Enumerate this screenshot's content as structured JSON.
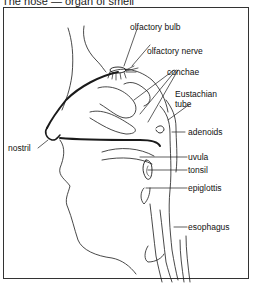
{
  "title": "The nose — organ of smell",
  "labels": {
    "olfactory_bulb": "olfactory bulb",
    "olfactory_nerve": "olfactory nerve",
    "conchae": "conchae",
    "eustachian_tube": "Eustachian tube",
    "eustachian_line1": "Eustachian",
    "eustachian_line2": "tube",
    "adenoids": "adenoids",
    "nostril": "nostril",
    "uvula": "uvula",
    "tonsil": "tonsil",
    "epiglottis": "epiglottis",
    "esophagus": "esophagus"
  },
  "colors": {
    "line": "#1a1a1a",
    "frame": "#333333",
    "background": "#ffffff"
  }
}
